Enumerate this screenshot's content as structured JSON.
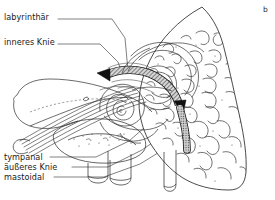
{
  "figure": {
    "panel_letter": "b",
    "caption_language": "de"
  },
  "labels": {
    "labyrinthaer": "labyrinthär",
    "inneres_knie": "inneres Knie",
    "tympanal": "tympanal",
    "aeusseres_knie": "äußeres Knie",
    "mastoidal": "mastoidal"
  },
  "colors": {
    "ink": "#1a1a1a",
    "line": "#2b2b2b",
    "hairline": "#555555",
    "faint": "#888888",
    "background": "#ffffff",
    "hatch_fill": "#6e6e6e",
    "arrow_fill": "#111111"
  },
  "leader_lines": {
    "labyrinthaer": "horizontal right, then diagonal down-right to inner knee region",
    "inneres_knie": "horizontal right, then diagonal down-right to nerve knee",
    "tympanal": "horizontal right, then diagonal up-right to tympanic segment",
    "aeusseres_knie": "horizontal right, then diagonal up-right to outer knee",
    "mastoidal": "horizontal right, then diagonal up-right to mastoid segment"
  }
}
